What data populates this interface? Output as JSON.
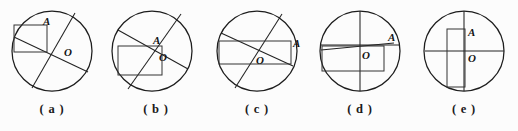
{
  "figure": {
    "type": "multiple-choice-geometry-diagram",
    "background_color": "#fcfcfc",
    "stroke_color": "#222222",
    "panel_count": 5,
    "panels": [
      {
        "caption": "( a )",
        "center_label": "O",
        "point_label": "A",
        "description": "Circle with two crossing chords through O and a rectangle whose corner touches the upper-left chord at A",
        "circle": {
          "cx": 52,
          "cy": 51,
          "r": 40
        },
        "chords": [
          {
            "x1": 14,
            "y1": 37,
            "x2": 88,
            "y2": 72
          },
          {
            "x1": 75,
            "y1": 13,
            "x2": 32,
            "y2": 88
          }
        ],
        "rect": {
          "x": 14,
          "y": 25,
          "w": 33,
          "h": 27
        },
        "label_A": {
          "x": 46,
          "y": 24
        },
        "label_O": {
          "x": 65,
          "y": 52
        }
      },
      {
        "caption": "( b )",
        "center_label": "O",
        "point_label": "A",
        "description": "Circle with two chords meeting at A near the center and a rectangle below-left of A",
        "circle": {
          "cx": 152,
          "cy": 51,
          "r": 40
        },
        "chords": [
          {
            "x1": 118,
            "y1": 30,
            "x2": 188,
            "y2": 69
          },
          {
            "x1": 181,
            "y1": 14,
            "x2": 128,
            "y2": 89
          }
        ],
        "rect": {
          "x": 118,
          "y": 46,
          "w": 44,
          "h": 29
        },
        "label_A": {
          "x": 155,
          "y": 42
        },
        "label_O": {
          "x": 160,
          "y": 58
        }
      },
      {
        "caption": "( c )",
        "center_label": "O",
        "point_label": "A",
        "description": "Circle with two crossing chords and a wide rectangle spanning the circle with A at its right edge",
        "circle": {
          "cx": 256,
          "cy": 51,
          "r": 40
        },
        "chords": [
          {
            "x1": 220,
            "y1": 33,
            "x2": 292,
            "y2": 66
          },
          {
            "x1": 281,
            "y1": 14,
            "x2": 234,
            "y2": 88
          }
        ],
        "rect": {
          "x": 218,
          "y": 41,
          "w": 72,
          "h": 23
        },
        "label_A": {
          "x": 292,
          "y": 44
        },
        "label_O": {
          "x": 258,
          "y": 60
        }
      },
      {
        "caption": "( d )",
        "center_label": "O",
        "point_label": "A",
        "description": "Circle with vertical and horizontal diameters through O, a slightly tilted chord to A and a rectangle below-left",
        "circle": {
          "cx": 360,
          "cy": 51,
          "r": 40
        },
        "chords": [
          {
            "x1": 360,
            "y1": 11,
            "x2": 360,
            "y2": 91
          },
          {
            "x1": 321,
            "y1": 45,
            "x2": 399,
            "y2": 45
          },
          {
            "x1": 321,
            "y1": 50,
            "x2": 394,
            "y2": 43
          }
        ],
        "rect": {
          "x": 322,
          "y": 46,
          "w": 62,
          "h": 25
        },
        "label_A": {
          "x": 391,
          "y": 39
        },
        "label_O": {
          "x": 363,
          "y": 55
        }
      },
      {
        "caption": "( e )",
        "center_label": "O",
        "point_label": "A",
        "description": "Circle with vertical and horizontal diameters and a tall narrow rectangle from A downward left of the vertical diameter",
        "circle": {
          "cx": 464,
          "cy": 51,
          "r": 40
        },
        "chords": [
          {
            "x1": 464,
            "y1": 11,
            "x2": 464,
            "y2": 91
          },
          {
            "x1": 425,
            "y1": 51,
            "x2": 504,
            "y2": 51
          }
        ],
        "rect": {
          "x": 447,
          "y": 29,
          "w": 18,
          "h": 58
        },
        "label_A": {
          "x": 468,
          "y": 34
        },
        "label_O": {
          "x": 468,
          "y": 59
        }
      }
    ]
  }
}
